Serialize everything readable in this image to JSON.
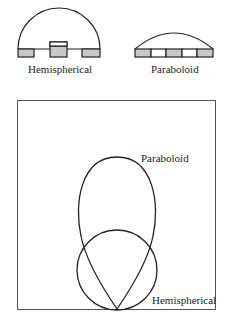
{
  "top_figures": {
    "hemispherical": {
      "caption": "Hemispherical",
      "dome": "semicircle",
      "base_segments": [
        "shaded",
        "shaded-raised",
        "shaded"
      ]
    },
    "paraboloid": {
      "caption": "Paraboloid",
      "dome": "shallow-arc",
      "base_segments": [
        "shaded",
        "white",
        "shaded",
        "white",
        "shaded"
      ]
    }
  },
  "pattern_plot": {
    "curves": [
      {
        "name": "Paraboloid",
        "label": "Paraboloid",
        "shape": "elongated-lobe"
      },
      {
        "name": "Hemispherical",
        "label": "Hemispherical",
        "shape": "circle"
      }
    ]
  },
  "colors": {
    "stroke": "#222222",
    "shade": "#c8c8c8",
    "frame": "#555555"
  }
}
